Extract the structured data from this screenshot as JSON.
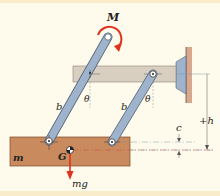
{
  "figure": {
    "background": "#fffbec",
    "band_color": "#f9eccb",
    "labels": {
      "moment": "M",
      "link_length_left": "b",
      "link_length_right": "b",
      "angle_left": "θ",
      "angle_right": "θ",
      "mass": "m",
      "center_of_gravity": "G",
      "weight": "mg",
      "height": "+h",
      "offset": "c"
    },
    "colors": {
      "upper_bar": "#d9cfc0",
      "upper_bar_stroke": "#8a8175",
      "block": "#c98a5e",
      "block_stroke": "#7a4a2c",
      "link": "#9fb4cc",
      "link_stroke": "#4d5f75",
      "mount": "#9fb4cc",
      "wall": "#d8a88e",
      "accent_red": "#e0321e",
      "dim_line": "#7a9aa8"
    }
  }
}
